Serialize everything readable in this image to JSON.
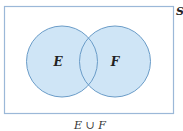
{
  "diagram": {
    "type": "venn",
    "universe_label": "S",
    "sets": [
      {
        "label": "E",
        "cx": 62,
        "cy": 61.5,
        "r": 35.5
      },
      {
        "label": "F",
        "cx": 115,
        "cy": 61.5,
        "r": 35.5
      }
    ],
    "caption": "E ∪ F",
    "colors": {
      "fill": "#cfe5f6",
      "stroke": "#6a9cc8",
      "frame": "#9bb8d8"
    }
  }
}
